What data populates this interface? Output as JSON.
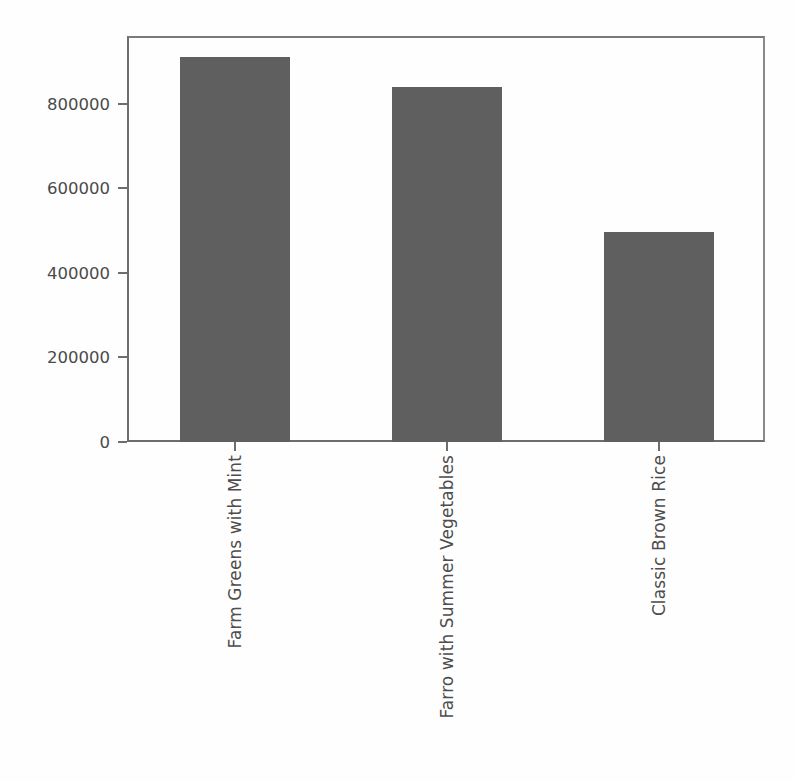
{
  "chart_data": {
    "type": "bar",
    "title": "",
    "xlabel": "",
    "ylabel": "",
    "categories": [
      "Farm Greens with Mint",
      "Farro with Summer Vegetables",
      "Classic Brown Rice"
    ],
    "values": [
      910000,
      840000,
      497000
    ],
    "ylim": [
      0,
      955000
    ],
    "yticks": [
      0,
      200000,
      400000,
      600000,
      800000
    ],
    "ytick_labels": [
      "0",
      "200000",
      "400000",
      "600000",
      "800000"
    ],
    "grid": false,
    "legend": null,
    "bar_color": "#5f5f5f",
    "axis_color": "#6d6d6d",
    "text_color": "#4a4a4a",
    "background_color": "#fefefe"
  },
  "axes": {
    "y": {
      "tick_labels": [
        "0",
        "200000",
        "400000",
        "600000",
        "800000"
      ]
    },
    "x": {
      "tick_labels": [
        "Farm Greens with Mint",
        "Farro with Summer Vegetables",
        "Classic Brown Rice"
      ]
    }
  }
}
